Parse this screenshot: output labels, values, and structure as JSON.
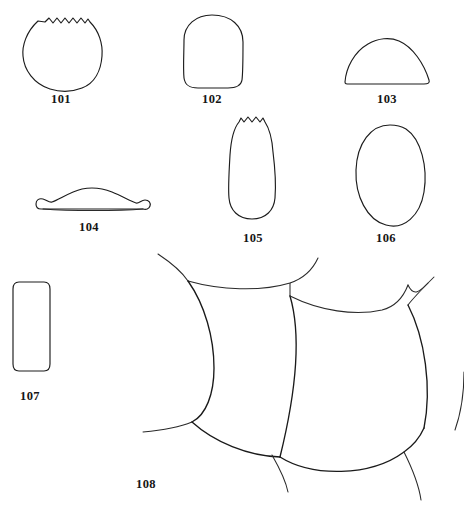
{
  "plate": {
    "type": "scientific-line-drawing-plate",
    "width": 464,
    "height": 510,
    "background_color": "#ffffff",
    "line_color": "#1c1c1c",
    "label_color": "#151515",
    "figure_count": 8
  },
  "figures": [
    {
      "number": "101",
      "label": "101",
      "shape": "rounded-subcircular outline with crenulate (wavy) dorsal margin",
      "label_x": 60,
      "label_y": 99,
      "bbox": {
        "x": 22,
        "y": 12,
        "w": 80,
        "h": 80
      }
    },
    {
      "number": "102",
      "label": "102",
      "shape": "rounded-quadrate barrel outline, smooth margins",
      "label_x": 211,
      "label_y": 99,
      "bbox": {
        "x": 182,
        "y": 14,
        "w": 62,
        "h": 74
      }
    },
    {
      "number": "103",
      "label": "103",
      "shape": "low dome / semicircular outline with flat ventral margin",
      "label_x": 386,
      "label_y": 99,
      "bbox": {
        "x": 343,
        "y": 38,
        "w": 88,
        "h": 46
      }
    },
    {
      "number": "104",
      "label": "104",
      "shape": "low flattened arch with recurved flanges at both ends",
      "label_x": 88,
      "label_y": 227,
      "bbox": {
        "x": 35,
        "y": 187,
        "w": 112,
        "h": 26
      }
    },
    {
      "number": "105",
      "label": "105",
      "shape": "elongate clavate (tulip-like) outline with crenulate apex",
      "label_x": 252,
      "label_y": 238,
      "bbox": {
        "x": 227,
        "y": 116,
        "w": 50,
        "h": 105
      }
    },
    {
      "number": "106",
      "label": "106",
      "shape": "vertical ovate / elliptical outline",
      "label_x": 385,
      "label_y": 238,
      "bbox": {
        "x": 355,
        "y": 124,
        "w": 70,
        "h": 103
      }
    },
    {
      "number": "107",
      "label": "107",
      "shape": "vertical rounded rectangle, parallel lateral margins",
      "label_x": 29,
      "label_y": 396,
      "bbox": {
        "x": 12,
        "y": 280,
        "w": 38,
        "h": 92
      }
    },
    {
      "number": "108",
      "label": "108",
      "shape": "group of large overlapping imbricate scales with arcuate sutures",
      "label_x": 145,
      "label_y": 484,
      "bbox": {
        "x": 130,
        "y": 252,
        "w": 334,
        "h": 258
      }
    }
  ]
}
